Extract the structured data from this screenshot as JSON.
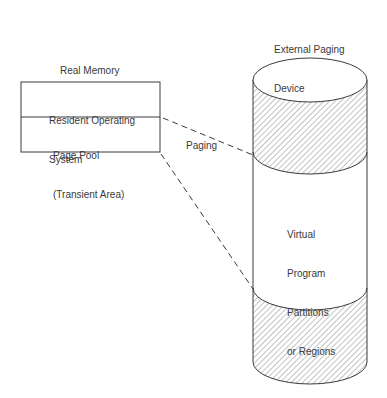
{
  "real_memory": {
    "title": "Real Memory",
    "sections": [
      {
        "label_line1": "Resident Operating",
        "label_line2": "System"
      },
      {
        "label_line1": "Page Pool",
        "label_line2": "(Transient Area)"
      }
    ]
  },
  "paging_label": "Paging",
  "external_device": {
    "title_line1": "External Paging",
    "title_line2": "Device",
    "middle_label": [
      "Virtual",
      "Program",
      "Partitions",
      "or Regions"
    ]
  },
  "colors": {
    "stroke": "#3a3a3a",
    "hatch": "#6a6a6a",
    "background": "#ffffff"
  }
}
